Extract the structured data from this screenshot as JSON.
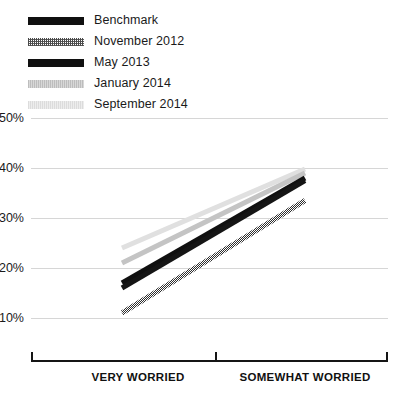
{
  "legend": {
    "position": "top-left",
    "entries": [
      {
        "label": "Benchmark",
        "swatch": "solid-black",
        "color": "#101010",
        "style": "solid"
      },
      {
        "label": "November 2012",
        "swatch": "hatched-dark-gray",
        "color": "#4a4a4a",
        "style": "hatched"
      },
      {
        "label": "May 2013",
        "swatch": "solid-black",
        "color": "#101010",
        "style": "solid"
      },
      {
        "label": "January 2014",
        "swatch": "light-gray",
        "color": "#c9c9c9",
        "style": "solid"
      },
      {
        "label": "September 2014",
        "swatch": "very-light-gray",
        "color": "#e2e2e2",
        "style": "solid"
      }
    ]
  },
  "yaxis": {
    "ticks": [
      "50%",
      "40%",
      "30%",
      "20%",
      "10%"
    ],
    "values": [
      50,
      40,
      30,
      20,
      10
    ],
    "min": 10,
    "max": 50,
    "gridlines": true
  },
  "xaxis": {
    "categories": [
      "VERY WORRIED",
      "SOMEWHAT WORRIED"
    ],
    "ticks": 3,
    "style": "bracket"
  },
  "chart_data": {
    "type": "line",
    "title": "",
    "subtitle": "",
    "xlabel": "",
    "ylabel": "",
    "categories": [
      "VERY WORRIED",
      "SOMEWHAT WORRIED"
    ],
    "ylim": [
      10,
      50
    ],
    "yticks": [
      10,
      20,
      30,
      40,
      50
    ],
    "ytick_labels": [
      "10%",
      "20%",
      "30%",
      "40%",
      "50%"
    ],
    "grid": true,
    "legend_position": "top-left",
    "series": [
      {
        "name": "Benchmark",
        "values": [
          17,
          38
        ],
        "color": "#101010",
        "style": "solid",
        "width": 5
      },
      {
        "name": "November 2012",
        "values": [
          11,
          33.5
        ],
        "color": "#3f3f3f",
        "style": "hatched",
        "width": 5
      },
      {
        "name": "May 2013",
        "values": [
          16,
          37.5
        ],
        "color": "#151515",
        "style": "solid",
        "width": 5
      },
      {
        "name": "January 2014",
        "values": [
          21,
          39
        ],
        "color": "#c4c4c4",
        "style": "solid",
        "width": 5
      },
      {
        "name": "September 2014",
        "values": [
          24,
          39.8
        ],
        "color": "#e0e0e0",
        "style": "solid",
        "width": 5
      }
    ]
  }
}
